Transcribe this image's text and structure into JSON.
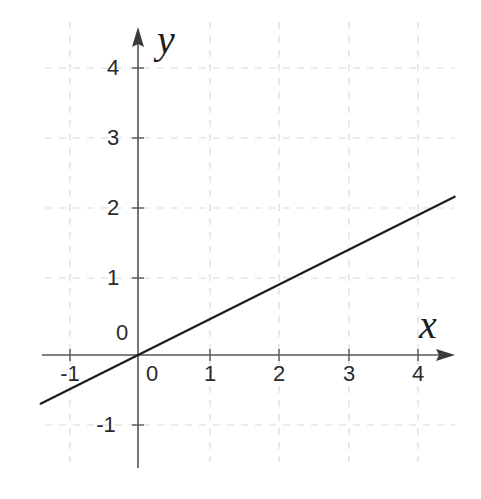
{
  "figure": {
    "width": 481,
    "height": 499,
    "background": "#ffffff"
  },
  "chart_data": {
    "type": "line",
    "title": "",
    "subtitle": "",
    "xlabel": "x",
    "ylabel": "y",
    "xlim": [
      -1.4,
      4.55
    ],
    "ylim": [
      -1.45,
      4.65
    ],
    "xticks": [
      -1,
      0,
      1,
      2,
      3,
      4
    ],
    "yticks": [
      -1,
      0,
      1,
      2,
      3,
      4
    ],
    "xtick_labels": [
      "-1",
      "0",
      "1",
      "2",
      "3",
      "4"
    ],
    "ytick_labels": [
      "-1",
      "0",
      "1",
      "2",
      "3",
      "4"
    ],
    "grid": true,
    "grid_style": "dashed",
    "grid_color": "#d9d9d9",
    "axis_color": "#4a4a4a",
    "legend": null,
    "legend_position": "none",
    "series": [
      {
        "name": "y = x/2",
        "equation": "y = 0.5x",
        "slope": 0.5,
        "intercept": 0,
        "color": "#1a1a1a",
        "x": [
          -1.4,
          4.55
        ],
        "y": [
          -0.7,
          2.275
        ],
        "points": [
          {
            "x": -1,
            "y": -0.5
          },
          {
            "x": 0,
            "y": 0
          },
          {
            "x": 1,
            "y": 0.5
          },
          {
            "x": 2,
            "y": 1
          },
          {
            "x": 3,
            "y": 1.5
          },
          {
            "x": 4,
            "y": 2
          }
        ]
      }
    ],
    "annotations": []
  },
  "axes": {
    "x_axis_label": "x",
    "y_axis_label": "y",
    "origin_label": "0"
  }
}
